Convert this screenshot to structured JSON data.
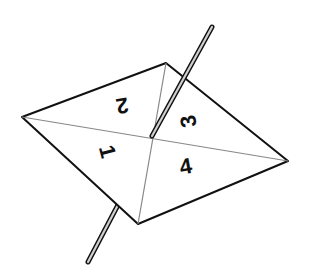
{
  "diagram": {
    "sections": [
      {
        "label": "1",
        "position": "left"
      },
      {
        "label": "2",
        "position": "top"
      },
      {
        "label": "3",
        "position": "right-top"
      },
      {
        "label": "4",
        "position": "right-bottom"
      }
    ],
    "colors": {
      "card_fill": "#ffffff",
      "outline": "#111111",
      "divider": "#888888",
      "stick": "#c8c8c8"
    }
  }
}
